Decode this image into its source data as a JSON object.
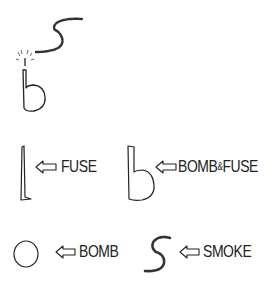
{
  "diagram": {
    "type": "hand-drawn legend",
    "colors": {
      "ink": "#222222",
      "background": "#ffffff"
    },
    "top_figure": {
      "name": "lit-bomb-b5",
      "description": "b-shaped bomb with sparking fuse and S-shaped smoke"
    },
    "legend": [
      {
        "symbol": "vertical-bar",
        "arrow": "⇦",
        "label": "FUSE"
      },
      {
        "symbol": "lowercase-b",
        "arrow": "⇦",
        "label_main": "BOMB",
        "label_amp": "&",
        "label_tail": "FUSE"
      },
      {
        "symbol": "circle",
        "arrow": "⇦",
        "label": "BOMB"
      },
      {
        "symbol": "s-squiggle",
        "arrow": "⇦",
        "label": "SMOKE"
      }
    ]
  }
}
